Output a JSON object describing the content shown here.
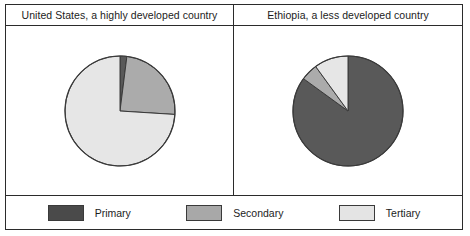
{
  "figure": {
    "panels": [
      {
        "title": "United States, a highly developed country"
      },
      {
        "title": "Ethiopia, a less developed country"
      }
    ],
    "legend": [
      {
        "label": "Primary",
        "color": "#4a4a4a"
      },
      {
        "label": "Secondary",
        "color": "#a8a8a8"
      },
      {
        "label": "Tertiary",
        "color": "#e4e4e4"
      }
    ]
  },
  "chart_data": [
    {
      "type": "pie",
      "title": "United States, a highly developed country",
      "labels": [
        "Primary",
        "Secondary",
        "Tertiary"
      ],
      "values": [
        2,
        24,
        74
      ],
      "colors": [
        "#595959",
        "#ababab",
        "#e6e6e6"
      ],
      "start_angle": 90,
      "direction": "clockwise",
      "legend_position": "bottom"
    },
    {
      "type": "pie",
      "title": "Ethiopia, a less developed country",
      "labels": [
        "Primary",
        "Secondary",
        "Tertiary"
      ],
      "values": [
        85,
        5,
        10
      ],
      "colors": [
        "#595959",
        "#ababab",
        "#e6e6e6"
      ],
      "start_angle": 90,
      "direction": "clockwise",
      "legend_position": "bottom"
    }
  ]
}
